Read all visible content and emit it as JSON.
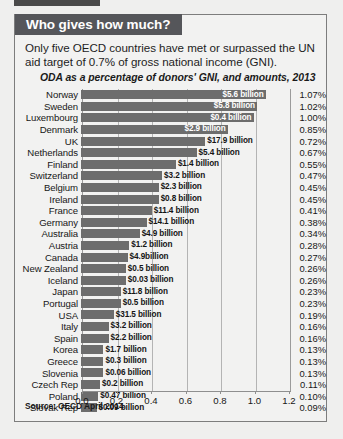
{
  "header": {
    "tab_title": "Who gives how much?"
  },
  "intro": "Only five OECD countries have met or surpassed the UN aid target of 0.7% of gross national income (GNI).",
  "source": "Source: OECD April 2014",
  "chart_data": {
    "type": "bar",
    "orientation": "horizontal",
    "title": "ODA as a percentage of donors' GNI, and amounts, 2013",
    "xlabel": "",
    "ylabel": "",
    "xlim": [
      0,
      1.2
    ],
    "grid": true,
    "legend": "none",
    "xticks": [
      "0.0",
      "0.2",
      "0.4",
      "0.6",
      "0.8",
      "1.0",
      "1.2"
    ],
    "xtick_values": [
      0.0,
      0.2,
      0.4,
      0.6,
      0.8,
      1.0,
      1.2
    ],
    "categories": [
      "Norway",
      "Sweden",
      "Luxembourg",
      "Denmark",
      "UK",
      "Netherlands",
      "Finland",
      "Switzerland",
      "Belgium",
      "Ireland",
      "France",
      "Germany",
      "Australia",
      "Austria",
      "Canada",
      "New Zealand",
      "Iceland",
      "Japan",
      "Portugal",
      "USA",
      "Italy",
      "Spain",
      "Korea",
      "Greece",
      "Slovenia",
      "Czech Rep",
      "Poland",
      "Slovak Rep"
    ],
    "values": [
      1.07,
      1.02,
      1.0,
      0.85,
      0.72,
      0.67,
      0.55,
      0.47,
      0.45,
      0.45,
      0.41,
      0.38,
      0.34,
      0.28,
      0.27,
      0.26,
      0.26,
      0.23,
      0.23,
      0.19,
      0.16,
      0.16,
      0.13,
      0.13,
      0.13,
      0.11,
      0.1,
      0.09
    ],
    "percent_labels": [
      "1.07%",
      "1.02%",
      "1.00%",
      "0.85%",
      "0.72%",
      "0.67%",
      "0.55%",
      "0.47%",
      "0.45%",
      "0.45%",
      "0.41%",
      "0.38%",
      "0.34%",
      "0.28%",
      "0.27%",
      "0.26%",
      "0.26%",
      "0.23%",
      "0.23%",
      "0.19%",
      "0.16%",
      "0.16%",
      "0.13%",
      "0.13%",
      "0.13%",
      "0.11%",
      "0.10%",
      "0.09%"
    ],
    "amount_labels": [
      "$5.6 billion",
      "$5.8 billion",
      "$0.4 billion",
      "$2.9 billion",
      "$17.9 billion",
      "$5.4 billion",
      "$1.4 billion",
      "$3.2 billion",
      "$2.3 billion",
      "$0.8 billion",
      "$11.4 billion",
      "$14.1 billion",
      "$4.9 billion",
      "$1.2 billion",
      "$4.9billion",
      "$0.5 billion",
      "$0.03 billion",
      "$11.8 billion",
      "$0.5 billion",
      "$31.5 billion",
      "$3.2 billion",
      "$2.2 billion",
      "$1.7 billion",
      "$0.3 billion",
      "$0.06 billion",
      "$0.2 billion",
      "$0.47 billion",
      "$0.09 billion"
    ],
    "amount_label_placement": [
      "inside",
      "inside",
      "inside",
      "inside",
      "outside",
      "outside",
      "outside",
      "outside",
      "outside",
      "outside",
      "outside",
      "outside",
      "outside",
      "outside",
      "outside",
      "outside",
      "outside",
      "outside",
      "outside",
      "outside",
      "outside",
      "outside",
      "outside",
      "outside",
      "outside",
      "outside",
      "outside",
      "outside"
    ],
    "colors": {
      "bar": "#6d6d6d",
      "header": "#55565a",
      "background": "#f2f2f1",
      "page": "#efefee",
      "text": "#171717"
    }
  }
}
